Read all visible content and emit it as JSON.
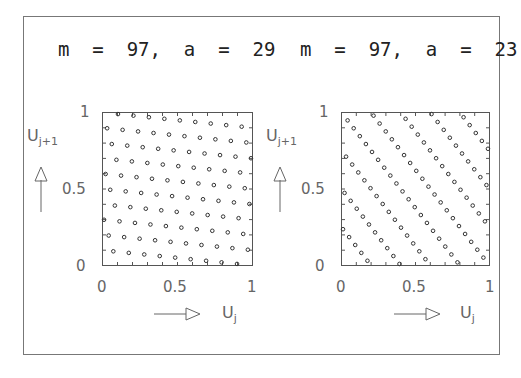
{
  "panels": [
    {
      "title": "m  =  97,  a  =  29",
      "m": 97,
      "a": 29
    },
    {
      "title": "m  =  97,  a  =  23",
      "m": 97,
      "a": 23
    }
  ],
  "axes": {
    "x_ticks": [
      "0",
      "0.5",
      "1"
    ],
    "y_ticks": [
      "0",
      "0.5",
      "1"
    ],
    "x_label": "U",
    "x_label_sub": "j",
    "y_label": "U",
    "y_label_sub": "j+1"
  },
  "chart_data": [
    {
      "type": "scatter",
      "title": "m = 97, a = 29",
      "xlabel": "U_j",
      "ylabel": "U_{j+1}",
      "xlim": [
        0,
        1
      ],
      "ylim": [
        0,
        1
      ],
      "grid": false,
      "marker": "open-circle",
      "description": "Pairs (x/97, (29x mod 97)/97) for x = 1..96",
      "x_numerators": [
        1,
        2,
        3,
        4,
        5,
        6,
        7,
        8,
        9,
        10,
        11,
        12,
        13,
        14,
        15,
        16,
        17,
        18,
        19,
        20,
        21,
        22,
        23,
        24,
        25,
        26,
        27,
        28,
        29,
        30,
        31,
        32,
        33,
        34,
        35,
        36,
        37,
        38,
        39,
        40,
        41,
        42,
        43,
        44,
        45,
        46,
        47,
        48,
        49,
        50,
        51,
        52,
        53,
        54,
        55,
        56,
        57,
        58,
        59,
        60,
        61,
        62,
        63,
        64,
        65,
        66,
        67,
        68,
        69,
        70,
        71,
        72,
        73,
        74,
        75,
        76,
        77,
        78,
        79,
        80,
        81,
        82,
        83,
        84,
        85,
        86,
        87,
        88,
        89,
        90,
        91,
        92,
        93,
        94,
        95,
        96
      ],
      "y_numerators": [
        29,
        58,
        87,
        19,
        48,
        77,
        9,
        38,
        67,
        96,
        28,
        57,
        86,
        18,
        47,
        76,
        8,
        37,
        66,
        95,
        27,
        56,
        85,
        17,
        46,
        75,
        7,
        36,
        65,
        94,
        26,
        55,
        84,
        16,
        45,
        74,
        6,
        35,
        64,
        93,
        25,
        54,
        83,
        15,
        44,
        73,
        5,
        34,
        63,
        92,
        24,
        53,
        82,
        14,
        43,
        72,
        4,
        33,
        62,
        91,
        23,
        52,
        81,
        13,
        42,
        71,
        3,
        32,
        61,
        90,
        22,
        51,
        80,
        12,
        41,
        70,
        2,
        31,
        60,
        89,
        21,
        50,
        79,
        11,
        40,
        69,
        1,
        30,
        59,
        88,
        20,
        49,
        78,
        10,
        39,
        68
      ],
      "denominator": 97
    },
    {
      "type": "scatter",
      "title": "m = 97, a = 23",
      "xlabel": "U_j",
      "ylabel": "U_{j+1}",
      "xlim": [
        0,
        1
      ],
      "ylim": [
        0,
        1
      ],
      "grid": false,
      "marker": "open-circle",
      "description": "Pairs (x/97, (23x mod 97)/97) for x = 1..96",
      "x_numerators": [
        1,
        2,
        3,
        4,
        5,
        6,
        7,
        8,
        9,
        10,
        11,
        12,
        13,
        14,
        15,
        16,
        17,
        18,
        19,
        20,
        21,
        22,
        23,
        24,
        25,
        26,
        27,
        28,
        29,
        30,
        31,
        32,
        33,
        34,
        35,
        36,
        37,
        38,
        39,
        40,
        41,
        42,
        43,
        44,
        45,
        46,
        47,
        48,
        49,
        50,
        51,
        52,
        53,
        54,
        55,
        56,
        57,
        58,
        59,
        60,
        61,
        62,
        63,
        64,
        65,
        66,
        67,
        68,
        69,
        70,
        71,
        72,
        73,
        74,
        75,
        76,
        77,
        78,
        79,
        80,
        81,
        82,
        83,
        84,
        85,
        86,
        87,
        88,
        89,
        90,
        91,
        92,
        93,
        94,
        95,
        96
      ],
      "y_numerators": [
        23,
        46,
        69,
        92,
        18,
        41,
        64,
        87,
        13,
        36,
        59,
        82,
        8,
        31,
        54,
        77,
        3,
        26,
        49,
        72,
        95,
        21,
        44,
        67,
        90,
        16,
        39,
        62,
        85,
        11,
        34,
        57,
        80,
        6,
        29,
        52,
        75,
        1,
        24,
        47,
        70,
        93,
        19,
        42,
        65,
        88,
        14,
        37,
        60,
        83,
        9,
        32,
        55,
        78,
        4,
        27,
        50,
        73,
        96,
        22,
        45,
        68,
        91,
        17,
        40,
        63,
        86,
        12,
        35,
        58,
        81,
        7,
        30,
        53,
        76,
        2,
        25,
        48,
        71,
        94,
        20,
        43,
        66,
        89,
        15,
        38,
        61,
        84,
        10,
        33,
        56,
        79,
        5,
        28,
        51,
        74
      ],
      "denominator": 97
    }
  ]
}
